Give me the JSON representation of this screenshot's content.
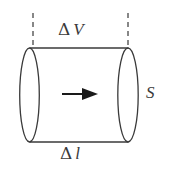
{
  "figure": {
    "background_color": "#ffffff",
    "stroke_color": "#3a3a3a",
    "labels": {
      "top": {
        "name": "delta-v",
        "delta": "Δ",
        "symbol": "V",
        "full": "Δ V",
        "meaning": "volume element"
      },
      "bottom": {
        "name": "delta-l",
        "delta": "Δ",
        "symbol": "l",
        "full": "Δ l",
        "meaning": "length element"
      },
      "right": {
        "name": "area-s",
        "symbol": "S",
        "full": "S",
        "meaning": "cross-sectional area"
      }
    },
    "geometry": {
      "left_ellipse": {
        "cx": 29.5,
        "cy": 95,
        "rx": 9.5,
        "ry": 47
      },
      "right_ellipse": {
        "cx": 128,
        "cy": 95,
        "rx": 10,
        "ry": 47
      },
      "top_edge": {
        "x1": 29.5,
        "y1": 48,
        "x2": 128,
        "y2": 48
      },
      "bottom_edge": {
        "x1": 29.5,
        "y1": 142,
        "x2": 128,
        "y2": 142
      },
      "arrow": {
        "x1": 62,
        "y1": 94,
        "x2": 97,
        "y2": 94,
        "direction": "right"
      },
      "dashed_lines": [
        {
          "x": 33,
          "y1": 13,
          "y2": 48
        },
        {
          "x": 128,
          "y1": 13,
          "y2": 48
        }
      ]
    }
  }
}
